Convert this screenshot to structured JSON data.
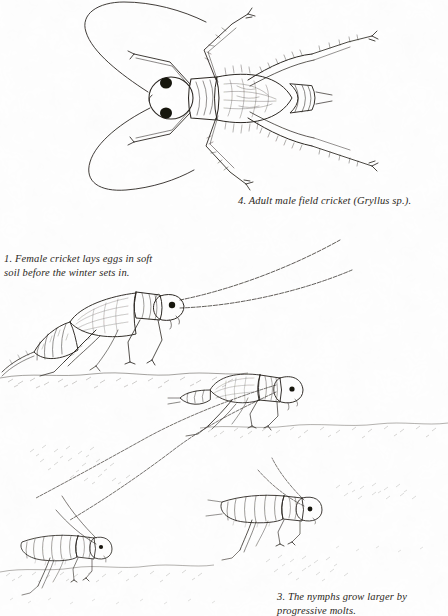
{
  "plate": {
    "title": "Field cricket life cycle illustration plate",
    "background_color": "#fefefe",
    "ink_color": "#2b2722",
    "width": 448,
    "height": 616
  },
  "captions": {
    "c1": {
      "number": "1.",
      "text": "1. Female cricket lays eggs in soft\nsoil before the winter sets in.",
      "line1": "1. Female cricket lays eggs in soft",
      "line2": "soil before the winter sets in."
    },
    "c3": {
      "number": "3.",
      "text": "3. The nymphs grow larger by\nprogressive molts.",
      "line1": "3. The nymphs grow larger by",
      "line2": "progressive molts."
    },
    "c4": {
      "number": "4.",
      "text": "4. Adult male field cricket (Gryllus sp.).",
      "line1": "4. Adult male field cricket (Gryllus sp.)."
    }
  },
  "figures": {
    "adult_dorsal": {
      "label": "adult male field cricket, dorsal view",
      "caption_ref": "4"
    },
    "female_lateral": {
      "label": "female cricket laying eggs, lateral view",
      "caption_ref": "1"
    },
    "nymph_late": {
      "label": "late instar nymph with wing pads",
      "caption_ref": "3"
    },
    "nymph_mid": {
      "label": "mid instar nymph",
      "caption_ref": "3"
    },
    "nymph_early": {
      "label": "early instar nymph",
      "caption_ref": "3"
    }
  }
}
